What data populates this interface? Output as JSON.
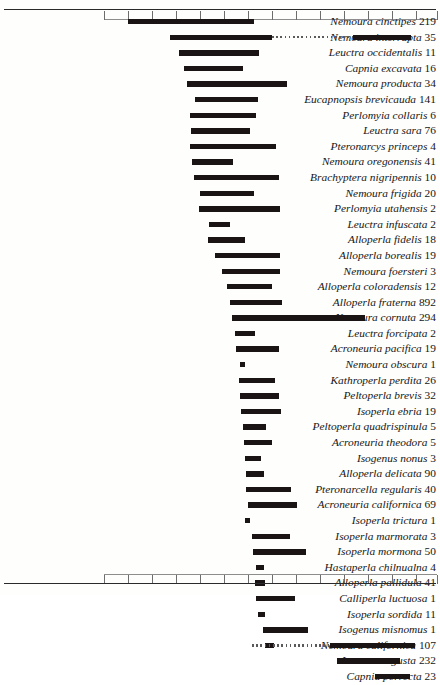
{
  "chart_data": {
    "type": "bar",
    "orientation": "horizontal-range",
    "title": "",
    "xlabel": "",
    "ylabel": "",
    "grid": false,
    "legend": null,
    "axis": {
      "top_line": true,
      "bottom_line": true,
      "tick_count": 15,
      "tick_positions_px": [
        104,
        128,
        152,
        176,
        200,
        224,
        248,
        272,
        296,
        320,
        344,
        368,
        392,
        416,
        437
      ],
      "top_tick_labels": [
        "",
        "",
        "",
        "",
        "",
        "",
        "",
        "",
        "",
        "",
        "",
        "",
        "",
        "",
        ""
      ]
    },
    "categories": [
      "Nemoura cinctipes",
      "Nemoura interrupta",
      "Leuctra occidentalis",
      "Capnia excavata",
      "Nemoura producta",
      "Eucapnopsis brevicauda",
      "Perlomyia collaris",
      "Leuctra sara",
      "Pteronarcys princeps",
      "Nemoura oregonensis",
      "Brachyptera nigripennis",
      "Nemoura frigida",
      "Perlomyia utahensis",
      "Leuctra infuscata",
      "Alloperla fidelis",
      "Alloperla borealis",
      "Nemoura foersteri",
      "Alloperla coloradensis",
      "Alloperla fraterna",
      "Nemoura cornuta",
      "Leuctra forcipata",
      "Acroneuria pacifica",
      "Nemoura obscura",
      "Kathroperla perdita",
      "Peltoperla brevis",
      "Isoperla ebria",
      "Peltoperla quadrispinula",
      "Acroneuria theodora",
      "Isogenus nonus",
      "Alloperla delicata",
      "Pteronarcella regularis",
      "Acroneuria californica",
      "Isoperla trictura",
      "Isoperla marmorata",
      "Isoperla mormona",
      "Hastaperla chilnualna",
      "Alloperla pallidula",
      "Calliperla luctuosa",
      "Isoperla sordida",
      "Isogenus misnomus",
      "Nemoura californica",
      "Leuctra augusta",
      "Capnia porrecta"
    ],
    "counts": [
      219,
      35,
      11,
      16,
      34,
      141,
      6,
      76,
      4,
      41,
      10,
      20,
      2,
      2,
      18,
      19,
      3,
      12,
      892,
      294,
      2,
      19,
      1,
      26,
      32,
      19,
      5,
      5,
      3,
      90,
      40,
      69,
      1,
      3,
      50,
      4,
      41,
      1,
      11,
      1,
      107,
      232,
      23
    ],
    "rows": [
      {
        "name": "Nemoura cinctipes",
        "count": 219,
        "start_px": 128,
        "end_px": 254,
        "segments": []
      },
      {
        "name": "Nemoura interrupta",
        "count": 35,
        "start_px": 170,
        "end_px": 272,
        "segments": [
          {
            "type": "dashed",
            "start_px": 272,
            "end_px": 353
          },
          {
            "type": "solid",
            "start_px": 353,
            "end_px": 411
          }
        ]
      },
      {
        "name": "Leuctra occidentalis",
        "count": 11,
        "start_px": 179,
        "end_px": 259,
        "segments": []
      },
      {
        "name": "Capnia excavata",
        "count": 16,
        "start_px": 184,
        "end_px": 243,
        "segments": []
      },
      {
        "name": "Nemoura producta",
        "count": 34,
        "start_px": 187,
        "end_px": 287,
        "segments": []
      },
      {
        "name": "Eucapnopsis brevicauda",
        "count": 141,
        "start_px": 195,
        "end_px": 258,
        "segments": []
      },
      {
        "name": "Perlomyia collaris",
        "count": 6,
        "start_px": 190,
        "end_px": 256,
        "segments": []
      },
      {
        "name": "Leuctra sara",
        "count": 76,
        "start_px": 191,
        "end_px": 250,
        "segments": []
      },
      {
        "name": "Pteronarcys princeps",
        "count": 4,
        "start_px": 190,
        "end_px": 276,
        "segments": []
      },
      {
        "name": "Nemoura oregonensis",
        "count": 41,
        "start_px": 192,
        "end_px": 233,
        "segments": []
      },
      {
        "name": "Brachyptera nigripennis",
        "count": 10,
        "start_px": 194,
        "end_px": 279,
        "segments": []
      },
      {
        "name": "Nemoura frigida",
        "count": 20,
        "start_px": 200,
        "end_px": 254,
        "segments": []
      },
      {
        "name": "Perlomyia utahensis",
        "count": 2,
        "start_px": 199,
        "end_px": 280,
        "segments": []
      },
      {
        "name": "Leuctra infuscata",
        "count": 2,
        "start_px": 209,
        "end_px": 230,
        "segments": []
      },
      {
        "name": "Alloperla fidelis",
        "count": 18,
        "start_px": 208,
        "end_px": 245,
        "segments": []
      },
      {
        "name": "Alloperla borealis",
        "count": 19,
        "start_px": 215,
        "end_px": 280,
        "segments": []
      },
      {
        "name": "Nemoura foersteri",
        "count": 3,
        "start_px": 222,
        "end_px": 280,
        "segments": []
      },
      {
        "name": "Alloperla coloradensis",
        "count": 12,
        "start_px": 227,
        "end_px": 272,
        "segments": []
      },
      {
        "name": "Alloperla fraterna",
        "count": 892,
        "start_px": 230,
        "end_px": 282,
        "segments": []
      },
      {
        "name": "Nemoura cornuta",
        "count": 294,
        "start_px": 232,
        "end_px": 365,
        "segments": []
      },
      {
        "name": "Leuctra forcipata",
        "count": 2,
        "start_px": 235,
        "end_px": 255,
        "segments": []
      },
      {
        "name": "Acroneuria pacifica",
        "count": 19,
        "start_px": 236,
        "end_px": 279,
        "segments": []
      },
      {
        "name": "Nemoura obscura",
        "count": 1,
        "start_px": 240,
        "end_px": 245,
        "segments": []
      },
      {
        "name": "Kathroperla perdita",
        "count": 26,
        "start_px": 239,
        "end_px": 275,
        "segments": []
      },
      {
        "name": "Peltoperla brevis",
        "count": 32,
        "start_px": 240,
        "end_px": 279,
        "segments": []
      },
      {
        "name": "Isoperla ebria",
        "count": 19,
        "start_px": 241,
        "end_px": 281,
        "segments": []
      },
      {
        "name": "Peltoperla quadrispinula",
        "count": 5,
        "start_px": 243,
        "end_px": 266,
        "segments": []
      },
      {
        "name": "Acroneuria theodora",
        "count": 5,
        "start_px": 244,
        "end_px": 272,
        "segments": []
      },
      {
        "name": "Isogenus nonus",
        "count": 3,
        "start_px": 245,
        "end_px": 261,
        "segments": []
      },
      {
        "name": "Alloperla delicata",
        "count": 90,
        "start_px": 246,
        "end_px": 264,
        "segments": []
      },
      {
        "name": "Pteronarcella regularis",
        "count": 40,
        "start_px": 246,
        "end_px": 291,
        "segments": []
      },
      {
        "name": "Acroneuria californica",
        "count": 69,
        "start_px": 248,
        "end_px": 297,
        "segments": []
      },
      {
        "name": "Isoperla trictura",
        "count": 1,
        "start_px": 245,
        "end_px": 250,
        "segments": []
      },
      {
        "name": "Isoperla marmorata",
        "count": 3,
        "start_px": 252,
        "end_px": 290,
        "segments": []
      },
      {
        "name": "Isoperla mormona",
        "count": 50,
        "start_px": 253,
        "end_px": 306,
        "segments": []
      },
      {
        "name": "Hastaperla chilnualna",
        "count": 4,
        "start_px": 256,
        "end_px": 264,
        "segments": []
      },
      {
        "name": "Alloperla pallidula",
        "count": 41,
        "start_px": 255,
        "end_px": 265,
        "segments": []
      },
      {
        "name": "Calliperla luctuosa",
        "count": 1,
        "start_px": 256,
        "end_px": 295,
        "segments": []
      },
      {
        "name": "Isoperla sordida",
        "count": 11,
        "start_px": 258,
        "end_px": 265,
        "segments": []
      },
      {
        "name": "Isogenus misnomus",
        "count": 1,
        "start_px": 263,
        "end_px": 308,
        "segments": []
      },
      {
        "name": "Nemoura californica",
        "count": 107,
        "start_px": 265,
        "end_px": 274,
        "segments": [
          {
            "type": "dashed",
            "start_px": 252,
            "end_px": 330
          },
          {
            "type": "solid",
            "start_px": 330,
            "end_px": 415
          }
        ]
      },
      {
        "name": "Leuctra augusta",
        "count": 232,
        "start_px": 337,
        "end_px": 400,
        "segments": []
      },
      {
        "name": "Capnia porrecta",
        "count": 23,
        "start_px": 375,
        "end_px": 410,
        "segments": []
      }
    ]
  }
}
